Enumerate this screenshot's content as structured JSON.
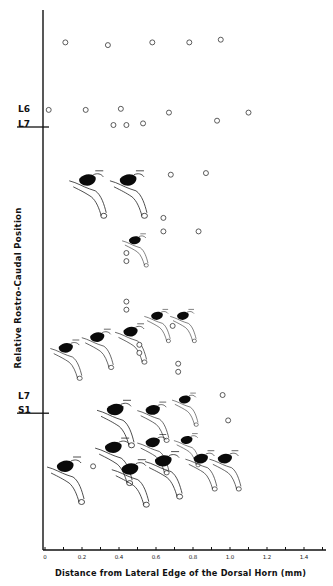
{
  "figure": {
    "x_axis_label": "Distance from Lateral Edge of the Dorsal Horn (mm)",
    "y_axis_label": "Relative Rostro-Caudal Position",
    "x_ticks": [
      "0",
      "0.2",
      "0.4",
      "0.6",
      "0.8",
      "1.0",
      "1.2",
      "1.4"
    ],
    "segment_boundaries": [
      {
        "upper": "L6",
        "lower": "L7"
      },
      {
        "upper": "L7",
        "lower": "S1"
      }
    ]
  },
  "chart_data": {
    "type": "scatter",
    "title": "",
    "xlabel": "Distance from Lateral Edge of the Dorsal Horn (mm)",
    "ylabel": "Relative Rostro-Caudal Position",
    "xlim": [
      0,
      1.5
    ],
    "x_tick_values": [
      0,
      0.2,
      0.4,
      0.6,
      0.8,
      1.0,
      1.2,
      1.4
    ],
    "x_minor_tick_step": 0.1,
    "grid": false,
    "legend": "none",
    "y_units": "relative rostro-caudal rank (0 = top/rostral, 1 = bottom/caudal)",
    "segment_boundaries": [
      {
        "label_upper": "L6",
        "label_lower": "L7",
        "y": 0.2
      },
      {
        "label_upper": "L7",
        "label_lower": "S1",
        "y": 0.73
      }
    ],
    "open_circles_no_receptive_field": [
      {
        "x": 0.11,
        "y": 0.06
      },
      {
        "x": 0.34,
        "y": 0.065
      },
      {
        "x": 0.58,
        "y": 0.06
      },
      {
        "x": 0.78,
        "y": 0.06
      },
      {
        "x": 0.95,
        "y": 0.055
      },
      {
        "x": 0.02,
        "y": 0.185
      },
      {
        "x": 0.22,
        "y": 0.185
      },
      {
        "x": 0.41,
        "y": 0.183
      },
      {
        "x": 0.67,
        "y": 0.19
      },
      {
        "x": 1.1,
        "y": 0.19
      },
      {
        "x": 0.37,
        "y": 0.213
      },
      {
        "x": 0.44,
        "y": 0.213
      },
      {
        "x": 0.53,
        "y": 0.21
      },
      {
        "x": 0.93,
        "y": 0.205
      },
      {
        "x": 0.68,
        "y": 0.305
      },
      {
        "x": 0.87,
        "y": 0.302
      },
      {
        "x": 0.64,
        "y": 0.385
      },
      {
        "x": 0.64,
        "y": 0.41
      },
      {
        "x": 0.83,
        "y": 0.41
      },
      {
        "x": 0.44,
        "y": 0.45
      },
      {
        "x": 0.44,
        "y": 0.465
      },
      {
        "x": 0.44,
        "y": 0.54
      },
      {
        "x": 0.44,
        "y": 0.555
      },
      {
        "x": 0.69,
        "y": 0.585
      },
      {
        "x": 0.51,
        "y": 0.62
      },
      {
        "x": 0.51,
        "y": 0.635
      },
      {
        "x": 0.72,
        "y": 0.655
      },
      {
        "x": 0.72,
        "y": 0.67
      },
      {
        "x": 0.96,
        "y": 0.713
      },
      {
        "x": 0.99,
        "y": 0.76
      },
      {
        "x": 0.26,
        "y": 0.845
      }
    ],
    "receptive_field_drawings": [
      {
        "x": 0.25,
        "y": 0.32,
        "size": "large"
      },
      {
        "x": 0.47,
        "y": 0.32,
        "size": "large"
      },
      {
        "x": 0.5,
        "y": 0.43,
        "size": "small"
      },
      {
        "x": 0.13,
        "y": 0.63,
        "size": "medium"
      },
      {
        "x": 0.3,
        "y": 0.61,
        "size": "medium"
      },
      {
        "x": 0.48,
        "y": 0.6,
        "size": "medium"
      },
      {
        "x": 0.62,
        "y": 0.57,
        "size": "small"
      },
      {
        "x": 0.76,
        "y": 0.57,
        "size": "small"
      },
      {
        "x": 0.4,
        "y": 0.745,
        "size": "large"
      },
      {
        "x": 0.6,
        "y": 0.745,
        "size": "medium"
      },
      {
        "x": 0.77,
        "y": 0.725,
        "size": "small"
      },
      {
        "x": 0.39,
        "y": 0.815,
        "size": "large"
      },
      {
        "x": 0.6,
        "y": 0.805,
        "size": "medium"
      },
      {
        "x": 0.78,
        "y": 0.8,
        "size": "small"
      },
      {
        "x": 0.13,
        "y": 0.85,
        "size": "large"
      },
      {
        "x": 0.48,
        "y": 0.855,
        "size": "large"
      },
      {
        "x": 0.66,
        "y": 0.84,
        "size": "large"
      },
      {
        "x": 0.86,
        "y": 0.835,
        "size": "medium"
      },
      {
        "x": 0.99,
        "y": 0.835,
        "size": "medium"
      }
    ]
  }
}
